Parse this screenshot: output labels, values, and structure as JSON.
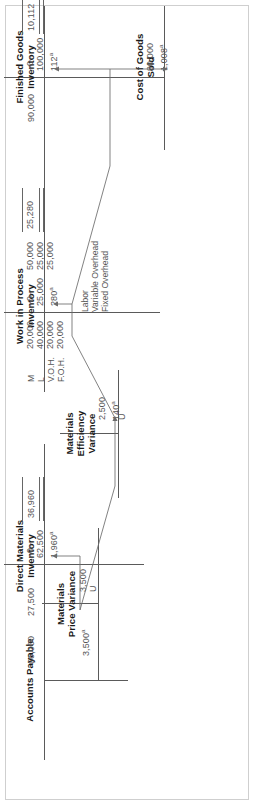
{
  "figure": {
    "kind": "t-account-flow-diagram",
    "orientation": "rotated-90-ccw"
  },
  "accounts": {
    "accounts_payable": {
      "title": "Accounts Payable",
      "credit": [
        "66,000"
      ]
    },
    "direct_materials_inventory": {
      "title": "Direct Materials\nInventory",
      "debit": [
        "–0–",
        "62,500",
        "1,960"
      ],
      "debit_sup": "a",
      "credit": [
        "27,500"
      ],
      "balance": "36,960"
    },
    "materials_price_variance": {
      "title": "Materials\nPrice Variance",
      "debit": [
        "3,500",
        "U"
      ],
      "credit": [
        "3,500"
      ],
      "credit_sup": "a"
    },
    "materials_efficiency_variance": {
      "title": "Materials\nEfficiency\nVariance",
      "debit": [
        "2,500",
        "140",
        "U"
      ],
      "debit_sup": "a"
    },
    "work_in_process_inventory": {
      "title": "Work in Process\nInventory",
      "debit": [
        "–0–",
        "25,000",
        "280"
      ],
      "debit_sup": "a",
      "credit_tags": [
        "M",
        "L",
        "V.O.H.",
        "F.O.H."
      ],
      "credit": [
        "20,000",
        "40,000",
        "20,000",
        "20,000"
      ],
      "balance_lines": [
        "50,000",
        "25,000",
        "25,000"
      ],
      "balance": "25,280",
      "side_labels": [
        "Labor",
        "Variable Overhead",
        "Fixed Overhead"
      ]
    },
    "finished_goods_inventory": {
      "title": "Finished Goods\nInventory",
      "debit": [
        "–0–",
        "100,000",
        "112"
      ],
      "debit_sup": "a",
      "credit": [
        "90,000"
      ],
      "balance": "10,112"
    },
    "cost_of_goods_sold": {
      "title": "Cost of Goods\nSold",
      "debit": [
        "90,000",
        "1,008"
      ],
      "debit_sup": "a"
    }
  },
  "colors": {
    "rule": "#5a5a5a",
    "text": "#555555",
    "title": "#1a1a1a",
    "border": "#cfcfcf"
  }
}
